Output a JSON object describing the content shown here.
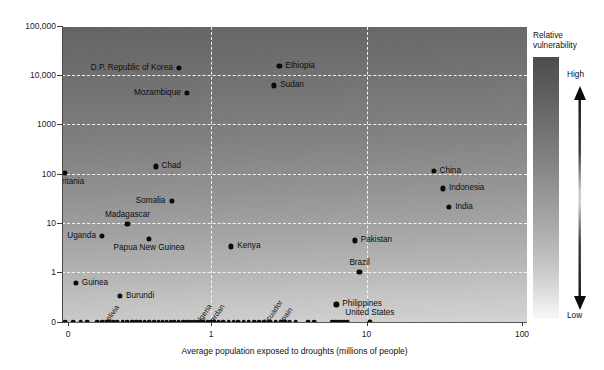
{
  "chart_data": {
    "type": "scatter",
    "title": "",
    "xlabel": "Average population exposed to droughts (millions of people)",
    "ylabel": "",
    "xscale": "log",
    "yscale": "log",
    "grid": true,
    "xticks": [
      "0",
      "1",
      "10",
      "100"
    ],
    "yticks": [
      "100,000",
      "10,000",
      "1000",
      "100",
      "10",
      "1",
      "0"
    ],
    "xlim": [
      0,
      100
    ],
    "ylim": [
      0,
      100000
    ],
    "legend_position": "right",
    "points": [
      {
        "name": "D.P. Republic of Korea",
        "x": 0.62,
        "y": 14000,
        "label_side": "left"
      },
      {
        "name": "Ethiopia",
        "x": 2.75,
        "y": 15500,
        "label_side": "right"
      },
      {
        "name": "Sudan",
        "x": 2.55,
        "y": 6200,
        "label_side": "right"
      },
      {
        "name": "Mozambique",
        "x": 0.7,
        "y": 4300,
        "label_side": "left"
      },
      {
        "name": "Chad",
        "x": 0.44,
        "y": 140,
        "label_side": "right"
      },
      {
        "name": "China",
        "x": 27.0,
        "y": 115,
        "label_side": "right"
      },
      {
        "name": "Mauritania",
        "x": 0.115,
        "y": 105,
        "label_side": "below"
      },
      {
        "name": "Indonesia",
        "x": 31.0,
        "y": 50,
        "label_side": "right"
      },
      {
        "name": "Somalia",
        "x": 0.56,
        "y": 28,
        "label_side": "left"
      },
      {
        "name": "India",
        "x": 34.0,
        "y": 21,
        "label_side": "right"
      },
      {
        "name": "Madagascar",
        "x": 0.29,
        "y": 9.5,
        "label_side": "above"
      },
      {
        "name": "Uganda",
        "x": 0.2,
        "y": 5.4,
        "label_side": "left"
      },
      {
        "name": "Papua New Guinea",
        "x": 0.4,
        "y": 4.7,
        "label_side": "below"
      },
      {
        "name": "Pakistan",
        "x": 8.4,
        "y": 4.4,
        "label_side": "right"
      },
      {
        "name": "Kenya",
        "x": 1.35,
        "y": 3.3,
        "label_side": "right"
      },
      {
        "name": "Brazil",
        "x": 9.0,
        "y": 1.0,
        "label_side": "above"
      },
      {
        "name": "Guinea",
        "x": 0.135,
        "y": 0.6,
        "label_side": "right"
      },
      {
        "name": "Burundi",
        "x": 0.26,
        "y": 0.33,
        "label_side": "right"
      },
      {
        "name": "Philippines",
        "x": 6.4,
        "y": 0.22,
        "label_side": "right"
      },
      {
        "name": "Bolivia",
        "x": 0.22,
        "y": 0,
        "label_side": "rotated"
      },
      {
        "name": "Algeria",
        "x": 0.86,
        "y": 0,
        "label_side": "rotated"
      },
      {
        "name": "Jordan",
        "x": 1.05,
        "y": 0,
        "label_side": "rotated"
      },
      {
        "name": "Ecuador",
        "x": 2.35,
        "y": 0,
        "label_side": "rotated"
      },
      {
        "name": "Spain",
        "x": 2.95,
        "y": 0,
        "label_side": "rotated"
      },
      {
        "name": "United States",
        "x": 10.5,
        "y": 0,
        "label_side": "above"
      }
    ],
    "zero_row_note": "Dense row of unlabeled countries plotted at y = 0 along the x-axis",
    "zero_row_x": [
      0.055,
      0.075,
      0.095,
      0.115,
      0.13,
      0.145,
      0.16,
      0.185,
      0.2,
      0.215,
      0.235,
      0.25,
      0.27,
      0.29,
      0.31,
      0.33,
      0.35,
      0.375,
      0.4,
      0.43,
      0.46,
      0.49,
      0.52,
      0.55,
      0.58,
      0.62,
      0.66,
      0.7,
      0.74,
      0.78,
      0.82,
      0.86,
      0.9,
      0.95,
      1.0,
      1.05,
      1.12,
      1.2,
      1.3,
      1.4,
      1.5,
      1.62,
      1.75,
      1.9,
      2.05,
      2.2,
      2.4,
      2.6,
      2.8,
      3.0,
      3.2,
      3.5,
      4.2,
      4.6,
      6.0,
      6.3,
      6.6,
      6.9,
      7.2,
      7.5,
      10.5
    ]
  },
  "legend": {
    "title": "Relative\nvulnerability",
    "title_line1": "Relative",
    "title_line2": "vulnerability",
    "high_label": "High",
    "low_label": "Low",
    "gradient_top_color": "#4d4d4d",
    "gradient_bottom_color": "#f8f8f8",
    "arrow_name": "double-headed-vertical-arrow"
  }
}
